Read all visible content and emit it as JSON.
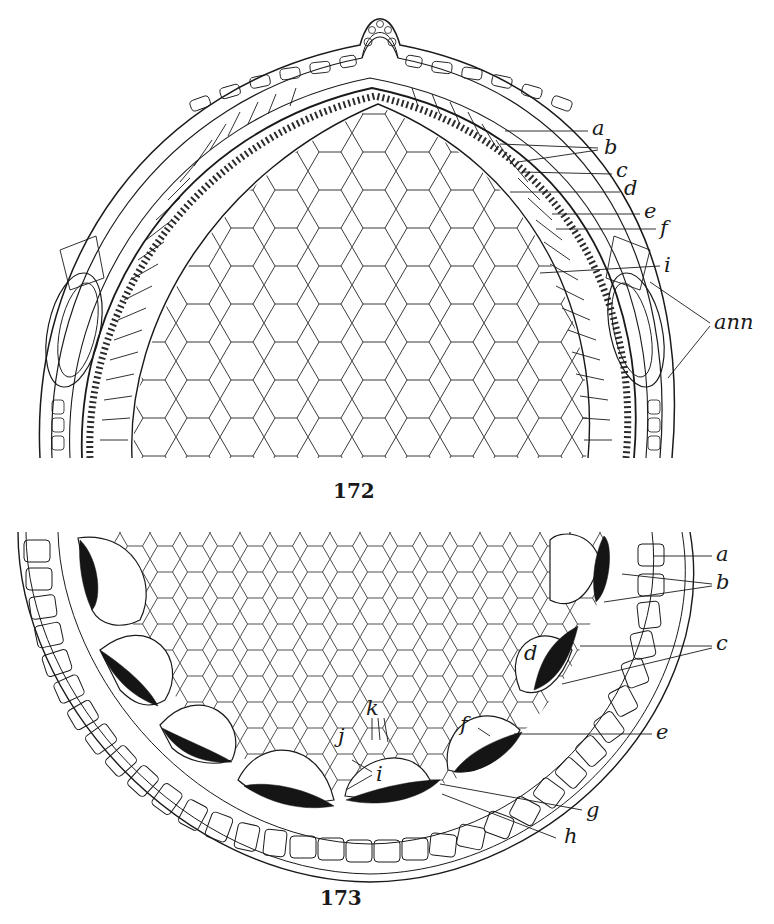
{
  "figures": [
    {
      "number": "172",
      "labels": {
        "a": "a",
        "b": "b",
        "c": "c",
        "d": "d",
        "e": "e",
        "f": "f",
        "i": "i",
        "ann": "ann"
      }
    },
    {
      "number": "173",
      "labels": {
        "a": "a",
        "b": "b",
        "c": "c",
        "d": "d",
        "e": "e",
        "f": "f",
        "g": "g",
        "h": "h",
        "i": "i",
        "j": "j",
        "k": "k"
      }
    }
  ],
  "colors": {
    "ink": "#1a1a1a",
    "background": "#ffffff",
    "filled_cell": "#151515"
  }
}
